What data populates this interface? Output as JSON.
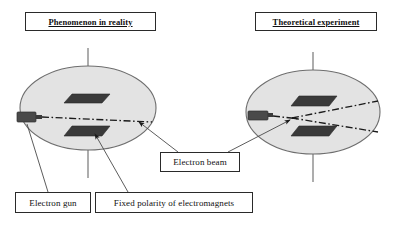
{
  "diagram": {
    "type": "physics-illustration",
    "colors": {
      "ellipse_fill": "#e3e3e3",
      "ellipse_stroke": "#6e6e6e",
      "plate_fill": "#3a3a3a",
      "gun_fill": "#4a4a4a",
      "line": "#1a1a1a",
      "box_border": "#2a2a2a",
      "background": "#ffffff"
    },
    "titles": [
      {
        "id": "left-title",
        "label": "Phenomenon in reality"
      },
      {
        "id": "right-title",
        "label": "Theoretical experiment"
      }
    ],
    "callouts": [
      {
        "id": "electron-beam",
        "label": "Electron beam"
      },
      {
        "id": "electron-gun",
        "label": "Electron gun"
      },
      {
        "id": "fixed-polarity",
        "label": "Fixed polarity of electromagnets"
      }
    ],
    "scenes": [
      {
        "id": "scene-reality",
        "title": "Phenomenon in reality",
        "beam_count": 1,
        "beam_description": "single straight dash-dot beam",
        "plates": 2,
        "gun": 1
      },
      {
        "id": "scene-theoretical",
        "title": "Theoretical experiment",
        "beam_count": 2,
        "beam_description": "beam splits into two diverging dash-dot branches",
        "plates": 2,
        "gun": 1
      }
    ],
    "icons": {
      "ellipse": "ellipse-platform-icon",
      "plate": "electromagnet-plate-icon",
      "gun": "electron-gun-icon",
      "beam": "electron-beam-icon",
      "axis": "vertical-axis-icon",
      "leader": "leader-line-icon"
    }
  }
}
